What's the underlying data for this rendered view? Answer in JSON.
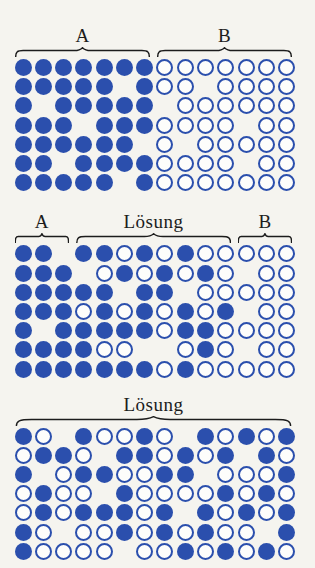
{
  "figure": {
    "labels": {
      "region_a": "A",
      "region_b": "B",
      "solution": "Lösung"
    },
    "colors": {
      "particle_blue": "#2b4fad",
      "ring_fill": "#fdfdfb",
      "text": "#1c1c1c",
      "background": "#f5f4ef"
    },
    "cell_legend": {
      "F": "filled-particle",
      "O": "open-particle",
      ".": "empty-site"
    },
    "grid_columns": 14,
    "grid_rows": 7,
    "panels": [
      {
        "name": "separated",
        "braces": [
          {
            "label": "A",
            "start": 1,
            "end": 7
          },
          {
            "label": "B",
            "start": 8,
            "end": 14
          }
        ],
        "rows": [
          "FFFFFFFOOOOOOO",
          "FFFFF.FOO.OOOO",
          "F.FFFFF.OOOOOO",
          "FFF.FFFOOOO.OO",
          "FFFFFF.O.OOOOO",
          "FF.FFFFOOOO.OO",
          "FFFFF.FOOOOOOO"
        ]
      },
      {
        "name": "partially-mixed",
        "braces": [
          {
            "label": "A",
            "start": 1,
            "end": 3
          },
          {
            "label": "Lösung",
            "start": 4,
            "end": 11
          },
          {
            "label": "B",
            "start": 12,
            "end": 14
          }
        ],
        "rows": [
          "FF.FFOFOFOOOOO",
          "FFF.OFOFOFO.OO",
          "FFFFF.FF.OOOOO",
          "FFFOFOFOFOF.OO",
          "F.FFFFFOFFOOOO",
          "FFFFOO..OFO.OO",
          "FFFFFFFOFOOOOO"
        ]
      },
      {
        "name": "solution",
        "braces": [
          {
            "label": "Lösung",
            "start": 1,
            "end": 14
          }
        ],
        "rows": [
          "FO.FOOFO.FOFOF",
          "OFFO.FFOFOF.FO",
          "F.OFFOOFF.OOOF",
          "OFOO.FOOOOFOFO",
          "OFOFFFOF.FOFOF",
          "FO.OOFOFOFOO.F",
          "FOOOO.OOFOFOFO"
        ]
      }
    ]
  }
}
